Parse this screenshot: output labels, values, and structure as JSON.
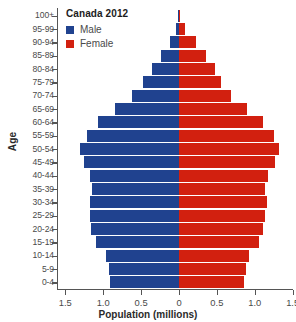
{
  "chart_data": {
    "type": "bar",
    "title": "Canada 2012",
    "xlabel": "Population (millions)",
    "ylabel": "Age",
    "orientation": "population-pyramid",
    "categories": [
      "0-4",
      "5-9",
      "10-14",
      "15-19",
      "20-24",
      "25-29",
      "30-34",
      "35-39",
      "40-44",
      "45-49",
      "50-54",
      "55-59",
      "60-64",
      "65-69",
      "70-74",
      "75-79",
      "80-84",
      "85-89",
      "90-94",
      "95-99",
      "100+"
    ],
    "xlim": [
      -1.5,
      1.5
    ],
    "xticks": [
      "1.5",
      "1.0",
      "0.5",
      "0",
      "0.5",
      "1.0",
      "1.5"
    ],
    "xtick_values": [
      -1.5,
      -1.0,
      -0.5,
      0,
      0.5,
      1.0,
      1.5
    ],
    "grid": false,
    "legend_position": "top-left",
    "series": [
      {
        "name": "Male",
        "color": "#20428f",
        "side": "left",
        "values": [
          0.91,
          0.93,
          0.96,
          1.1,
          1.16,
          1.18,
          1.18,
          1.15,
          1.18,
          1.25,
          1.3,
          1.22,
          1.07,
          0.85,
          0.62,
          0.47,
          0.36,
          0.24,
          0.12,
          0.035,
          0.005
        ]
      },
      {
        "name": "Female",
        "color": "#d2200f",
        "side": "right",
        "values": [
          0.86,
          0.89,
          0.92,
          1.05,
          1.11,
          1.14,
          1.16,
          1.14,
          1.18,
          1.26,
          1.32,
          1.25,
          1.11,
          0.9,
          0.68,
          0.55,
          0.47,
          0.36,
          0.22,
          0.08,
          0.015
        ]
      }
    ]
  },
  "legend": {
    "title": "Canada 2012",
    "entries": [
      {
        "label": "Male",
        "color": "#20428f"
      },
      {
        "label": "Female",
        "color": "#d2200f"
      }
    ]
  },
  "axes": {
    "y_title": "Age",
    "x_title": "Population (millions)"
  }
}
